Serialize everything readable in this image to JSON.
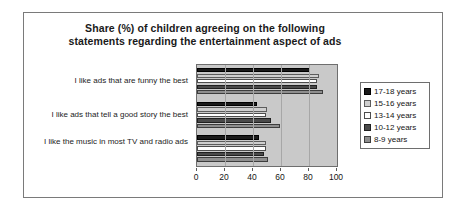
{
  "chart_data": {
    "type": "bar",
    "orientation": "horizontal",
    "title": "Share (%) of children agreeing on the following statements regarding the entertainment aspect of ads",
    "title_line1": "Share (%) of children agreeing on the following",
    "title_line2": "statements regarding the entertainment aspect of ads",
    "xlabel": "",
    "ylabel": "",
    "xlim": [
      0,
      100
    ],
    "xticks": [
      0,
      20,
      40,
      60,
      80,
      100
    ],
    "xtick_labels": [
      "0",
      "20",
      "40",
      "60",
      "80",
      "100"
    ],
    "grid": true,
    "legend_position": "right",
    "categories": [
      "I like ads that are funny the best",
      "I like ads that tell a good story the best",
      "I like the music in most TV and radio ads"
    ],
    "series": [
      {
        "name": "17-18 years",
        "color": "#1a1a1a",
        "values": [
          81,
          43,
          44
        ]
      },
      {
        "name": "15-16 years",
        "color": "#cfcfcf",
        "values": [
          87,
          50,
          49
        ]
      },
      {
        "name": "13-14 years",
        "color": "#ffffff",
        "values": [
          86,
          49,
          49
        ]
      },
      {
        "name": "10-12 years",
        "color": "#4a4a4a",
        "values": [
          86,
          53,
          48
        ]
      },
      {
        "name": "8-9 years",
        "color": "#8e8e8e",
        "values": [
          90,
          59,
          51
        ]
      }
    ],
    "plot_background": "#c9c9c9",
    "frame_color": "#6e6e6e"
  }
}
